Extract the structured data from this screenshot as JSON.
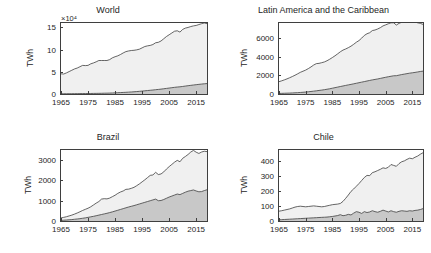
{
  "figure": {
    "background": "#ffffff",
    "axis_color": "#3f3f3f",
    "text_color": "#262626",
    "band_upper_color": "#f0f0f0",
    "band_lower_color": "#c8c8c8",
    "line_color": "#3f3f3f"
  },
  "chart_data": [
    {
      "type": "area",
      "title": "World",
      "xlabel": "",
      "ylabel": "TWh",
      "exponent_label": "×10⁴",
      "xlim": [
        1965,
        2019
      ],
      "ylim": [
        0,
        16
      ],
      "xticks": [
        1965,
        1975,
        1985,
        1995,
        2005,
        2015
      ],
      "xtick_labels": [
        "1965",
        "1975",
        "1985",
        "1995",
        "2005",
        "2015"
      ],
      "yticks": [
        0,
        5,
        10,
        15
      ],
      "ytick_labels": [
        "0",
        "5",
        "10",
        "15"
      ],
      "grid": false,
      "legend": "none",
      "x": [
        1965,
        1966,
        1967,
        1968,
        1969,
        1970,
        1971,
        1972,
        1973,
        1974,
        1975,
        1976,
        1977,
        1978,
        1979,
        1980,
        1981,
        1982,
        1983,
        1984,
        1985,
        1986,
        1987,
        1988,
        1989,
        1990,
        1991,
        1992,
        1993,
        1994,
        1995,
        1996,
        1997,
        1998,
        1999,
        2000,
        2001,
        2002,
        2003,
        2004,
        2005,
        2006,
        2007,
        2008,
        2009,
        2010,
        2011,
        2012,
        2013,
        2014,
        2015,
        2016,
        2017,
        2018,
        2019
      ],
      "series": [
        {
          "name": "Lower band",
          "values": [
            0.05,
            0.06,
            0.06,
            0.07,
            0.07,
            0.08,
            0.08,
            0.09,
            0.1,
            0.1,
            0.11,
            0.12,
            0.13,
            0.14,
            0.15,
            0.16,
            0.18,
            0.19,
            0.21,
            0.23,
            0.26,
            0.29,
            0.32,
            0.35,
            0.38,
            0.42,
            0.46,
            0.5,
            0.55,
            0.6,
            0.66,
            0.72,
            0.78,
            0.84,
            0.9,
            0.97,
            1.03,
            1.1,
            1.18,
            1.26,
            1.34,
            1.42,
            1.5,
            1.57,
            1.62,
            1.7,
            1.79,
            1.87,
            1.95,
            2.03,
            2.1,
            2.17,
            2.24,
            2.3,
            2.35
          ]
        },
        {
          "name": "Total (top curve)",
          "values": [
            4.55,
            4.5,
            4.75,
            5.05,
            5.35,
            5.65,
            5.85,
            6.15,
            6.45,
            6.4,
            6.45,
            6.8,
            7.0,
            7.25,
            7.55,
            7.55,
            7.55,
            7.55,
            7.75,
            8.15,
            8.4,
            8.6,
            8.9,
            9.25,
            9.55,
            9.7,
            9.8,
            9.85,
            9.95,
            10.1,
            10.4,
            10.7,
            10.85,
            10.95,
            11.15,
            11.55,
            11.65,
            11.95,
            12.45,
            12.95,
            13.35,
            13.75,
            14.15,
            14.25,
            13.95,
            14.55,
            14.85,
            15.0,
            15.2,
            15.35,
            15.45,
            15.65,
            15.85,
            16.0,
            15.85
          ]
        }
      ]
    },
    {
      "type": "area",
      "title": "Latin America and the Caribbean",
      "xlabel": "",
      "ylabel": "TWh",
      "exponent_label": "",
      "xlim": [
        1965,
        2019
      ],
      "ylim": [
        0,
        7600
      ],
      "xticks": [
        1965,
        1975,
        1985,
        1995,
        2005,
        2015
      ],
      "xtick_labels": [
        "1965",
        "1975",
        "1985",
        "1995",
        "2005",
        "2015"
      ],
      "yticks": [
        0,
        2000,
        4000,
        6000
      ],
      "ytick_labels": [
        "0",
        "2000",
        "4000",
        "6000"
      ],
      "grid": false,
      "legend": "none",
      "x": [
        1965,
        1966,
        1967,
        1968,
        1969,
        1970,
        1971,
        1972,
        1973,
        1974,
        1975,
        1976,
        1977,
        1978,
        1979,
        1980,
        1981,
        1982,
        1983,
        1984,
        1985,
        1986,
        1987,
        1988,
        1989,
        1990,
        1991,
        1992,
        1993,
        1994,
        1995,
        1996,
        1997,
        1998,
        1999,
        2000,
        2001,
        2002,
        2003,
        2004,
        2005,
        2006,
        2007,
        2008,
        2009,
        2010,
        2011,
        2012,
        2013,
        2014,
        2015,
        2016,
        2017,
        2018,
        2019
      ],
      "series": [
        {
          "name": "Lower band",
          "values": [
            60,
            70,
            80,
            90,
            100,
            115,
            130,
            145,
            165,
            185,
            210,
            240,
            270,
            305,
            340,
            380,
            420,
            460,
            510,
            560,
            620,
            680,
            740,
            800,
            860,
            920,
            975,
            1030,
            1090,
            1150,
            1210,
            1270,
            1330,
            1390,
            1450,
            1510,
            1560,
            1610,
            1670,
            1730,
            1790,
            1850,
            1900,
            1950,
            1960,
            2020,
            2080,
            2130,
            2180,
            2230,
            2270,
            2310,
            2360,
            2410,
            2450
          ]
        },
        {
          "name": "Total (top curve)",
          "values": [
            1320,
            1410,
            1510,
            1620,
            1740,
            1870,
            2010,
            2160,
            2320,
            2440,
            2560,
            2720,
            2900,
            3100,
            3250,
            3280,
            3350,
            3430,
            3560,
            3720,
            3900,
            4090,
            4300,
            4520,
            4700,
            4820,
            4960,
            5120,
            5320,
            5540,
            5720,
            5980,
            6270,
            6450,
            6560,
            6790,
            6850,
            6960,
            7100,
            7290,
            7400,
            7520,
            7620,
            7620,
            7380,
            7560,
            7680,
            7740,
            7820,
            7880,
            7920,
            7700,
            7620,
            7560,
            7450
          ]
        }
      ]
    },
    {
      "type": "area",
      "title": "Brazil",
      "xlabel": "",
      "ylabel": "TWh",
      "exponent_label": "",
      "xlim": [
        1965,
        2019
      ],
      "ylim": [
        0,
        3500
      ],
      "xticks": [
        1965,
        1975,
        1985,
        1995,
        2005,
        2015
      ],
      "xtick_labels": [
        "1965",
        "1975",
        "1985",
        "1995",
        "2005",
        "2015"
      ],
      "yticks": [
        0,
        1000,
        2000,
        3000
      ],
      "ytick_labels": [
        "0",
        "1000",
        "2000",
        "3000"
      ],
      "grid": false,
      "legend": "none",
      "x": [
        1965,
        1966,
        1967,
        1968,
        1969,
        1970,
        1971,
        1972,
        1973,
        1974,
        1975,
        1976,
        1977,
        1978,
        1979,
        1980,
        1981,
        1982,
        1983,
        1984,
        1985,
        1986,
        1987,
        1988,
        1989,
        1990,
        1991,
        1992,
        1993,
        1994,
        1995,
        1996,
        1997,
        1998,
        1999,
        2000,
        2001,
        2002,
        2003,
        2004,
        2005,
        2006,
        2007,
        2008,
        2009,
        2010,
        2011,
        2012,
        2013,
        2014,
        2015,
        2016,
        2017,
        2018,
        2019
      ],
      "series": [
        {
          "name": "Lower band",
          "values": [
            30,
            40,
            50,
            60,
            70,
            85,
            100,
            115,
            135,
            155,
            180,
            205,
            230,
            260,
            290,
            320,
            350,
            380,
            415,
            450,
            490,
            530,
            570,
            610,
            650,
            690,
            725,
            760,
            800,
            840,
            880,
            920,
            960,
            1000,
            1040,
            1080,
            1000,
            1010,
            1060,
            1120,
            1180,
            1230,
            1280,
            1330,
            1300,
            1360,
            1420,
            1470,
            1500,
            1530,
            1480,
            1440,
            1450,
            1500,
            1540
          ]
        },
        {
          "name": "Total (top curve)",
          "values": [
            150,
            180,
            210,
            250,
            290,
            340,
            395,
            455,
            520,
            575,
            630,
            700,
            790,
            880,
            960,
            1080,
            1100,
            1090,
            1130,
            1200,
            1270,
            1360,
            1430,
            1480,
            1560,
            1570,
            1610,
            1660,
            1740,
            1830,
            1930,
            2030,
            2140,
            2250,
            2270,
            2400,
            2290,
            2320,
            2420,
            2560,
            2680,
            2790,
            2900,
            2990,
            2920,
            3090,
            3180,
            3280,
            3400,
            3480,
            3390,
            3330,
            3400,
            3440,
            3420
          ]
        }
      ]
    },
    {
      "type": "area",
      "title": "Chile",
      "xlabel": "",
      "ylabel": "TWh",
      "exponent_label": "",
      "xlim": [
        1965,
        2019
      ],
      "ylim": [
        0,
        470
      ],
      "xticks": [
        1965,
        1975,
        1985,
        1995,
        2005,
        2015
      ],
      "xtick_labels": [
        "1965",
        "1975",
        "1985",
        "1995",
        "2005",
        "2015"
      ],
      "yticks": [
        0,
        100,
        200,
        300,
        400
      ],
      "ytick_labels": [
        "0",
        "100",
        "200",
        "300",
        "400"
      ],
      "grid": false,
      "legend": "none",
      "x": [
        1965,
        1966,
        1967,
        1968,
        1969,
        1970,
        1971,
        1972,
        1973,
        1974,
        1975,
        1976,
        1977,
        1978,
        1979,
        1980,
        1981,
        1982,
        1983,
        1984,
        1985,
        1986,
        1987,
        1988,
        1989,
        1990,
        1991,
        1992,
        1993,
        1994,
        1995,
        1996,
        1997,
        1998,
        1999,
        2000,
        2001,
        2002,
        2003,
        2004,
        2005,
        2006,
        2007,
        2008,
        2009,
        2010,
        2011,
        2012,
        2013,
        2014,
        2015,
        2016,
        2017,
        2018,
        2019
      ],
      "series": [
        {
          "name": "Lower band",
          "values": [
            8,
            9,
            10,
            11,
            12,
            13,
            14,
            15,
            16,
            17,
            18,
            19,
            20,
            21,
            22,
            23,
            24,
            25,
            26,
            28,
            30,
            33,
            36,
            42,
            35,
            38,
            44,
            40,
            52,
            62,
            58,
            50,
            62,
            56,
            60,
            68,
            62,
            58,
            64,
            72,
            66,
            60,
            68,
            62,
            58,
            64,
            68,
            66,
            64,
            68,
            66,
            70,
            72,
            76,
            82
          ]
        },
        {
          "name": "Total (top curve)",
          "values": [
            65,
            68,
            72,
            76,
            80,
            86,
            92,
            96,
            98,
            96,
            94,
            96,
            98,
            100,
            98,
            96,
            94,
            96,
            100,
            104,
            108,
            110,
            112,
            116,
            130,
            150,
            172,
            196,
            212,
            230,
            248,
            268,
            288,
            302,
            300,
            320,
            326,
            334,
            342,
            352,
            348,
            356,
            374,
            368,
            362,
            380,
            392,
            398,
            408,
            416,
            412,
            422,
            430,
            442,
            452
          ]
        }
      ]
    }
  ]
}
